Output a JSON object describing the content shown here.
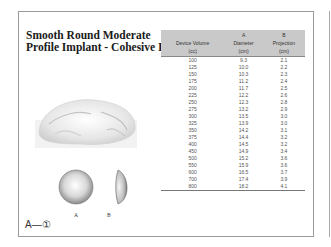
{
  "page": {
    "title_line1": "Smooth Round Moderate",
    "title_line2": "Profile Implant - Cohesive I",
    "footer_label": "A—①",
    "sphere_labels": [
      "A",
      "B"
    ]
  },
  "table": {
    "columns": [
      {
        "line1": "",
        "line2": "Device Volume",
        "line3": "(cc)"
      },
      {
        "line1": "A",
        "line2": "Diameter",
        "line3": "(cm)"
      },
      {
        "line1": "B",
        "line2": "Projection",
        "line3": "(cm)"
      }
    ],
    "rows": [
      [
        "100",
        "9.3",
        "2.1"
      ],
      [
        "125",
        "10.0",
        "2.2"
      ],
      [
        "150",
        "10.3",
        "2.3"
      ],
      [
        "175",
        "11.2",
        "2.4"
      ],
      [
        "200",
        "11.7",
        "2.5"
      ],
      [
        "225",
        "12.2",
        "2.6"
      ],
      [
        "250",
        "12.3",
        "2.8"
      ],
      [
        "275",
        "13.2",
        "2.9"
      ],
      [
        "300",
        "13.5",
        "3.0"
      ],
      [
        "325",
        "13.9",
        "3.0"
      ],
      [
        "350",
        "14.2",
        "3.1"
      ],
      [
        "375",
        "14.4",
        "3.2"
      ],
      [
        "400",
        "14.5",
        "3.2"
      ],
      [
        "450",
        "14.9",
        "3.4"
      ],
      [
        "500",
        "15.2",
        "3.6"
      ],
      [
        "550",
        "15.9",
        "3.6"
      ],
      [
        "600",
        "16.5",
        "3.7"
      ],
      [
        "700",
        "17.4",
        "3.9"
      ],
      [
        "800",
        "18.2",
        "4.1"
      ]
    ]
  }
}
